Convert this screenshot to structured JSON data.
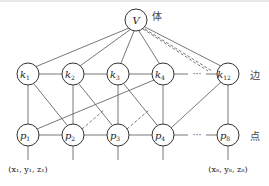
{
  "diagram": {
    "top_node": {
      "id": "V",
      "label": "V",
      "x": 136,
      "y": 20,
      "side_label": "体"
    },
    "edge_row": {
      "side_label": "边",
      "y": 74,
      "nodes": [
        {
          "id": "k1",
          "base": "k",
          "sub": "1",
          "x": 28
        },
        {
          "id": "k2",
          "base": "k",
          "sub": "2",
          "x": 73
        },
        {
          "id": "k3",
          "base": "k",
          "sub": "3",
          "x": 118
        },
        {
          "id": "k4",
          "base": "k",
          "sub": "4",
          "x": 163
        },
        {
          "id": "k12",
          "base": "k",
          "sub": "12",
          "x": 228
        }
      ],
      "ellipsis": "···"
    },
    "point_row": {
      "side_label": "点",
      "y": 135,
      "nodes": [
        {
          "id": "p1",
          "base": "p",
          "sub": "1",
          "x": 28
        },
        {
          "id": "p2",
          "base": "p",
          "sub": "2",
          "x": 73
        },
        {
          "id": "p3",
          "base": "p",
          "sub": "3",
          "x": 118
        },
        {
          "id": "p4",
          "base": "p",
          "sub": "4",
          "x": 163
        },
        {
          "id": "p8",
          "base": "p",
          "sub": "8",
          "x": 228
        }
      ],
      "ellipsis": "···"
    },
    "coordinates": {
      "first": "(x₁, y₁, z₁)",
      "last": "(x₈, y₈, z₈)"
    },
    "edges_solid": [
      [
        "V",
        "k1"
      ],
      [
        "V",
        "k2"
      ],
      [
        "V",
        "k3"
      ],
      [
        "V",
        "k4"
      ],
      [
        "V",
        "k12"
      ],
      [
        "k1",
        "k2"
      ],
      [
        "k2",
        "k3"
      ],
      [
        "k3",
        "k4"
      ],
      [
        "p1",
        "p2"
      ],
      [
        "p2",
        "p3"
      ],
      [
        "p3",
        "p4"
      ],
      [
        "k1",
        "p1"
      ],
      [
        "k1",
        "p2"
      ],
      [
        "k2",
        "p2"
      ],
      [
        "k2",
        "p3"
      ],
      [
        "k3",
        "p3"
      ],
      [
        "k3",
        "p4"
      ],
      [
        "k4",
        "p4"
      ],
      [
        "k4",
        "p1"
      ],
      [
        "k12",
        "p8"
      ],
      [
        "k12",
        "p4"
      ]
    ],
    "edges_dashed": [
      [
        "V",
        "k12_a"
      ],
      [
        "V",
        "k12_b"
      ],
      [
        "p2",
        "k3_mid"
      ],
      [
        "p3",
        "k4_mid"
      ]
    ]
  }
}
